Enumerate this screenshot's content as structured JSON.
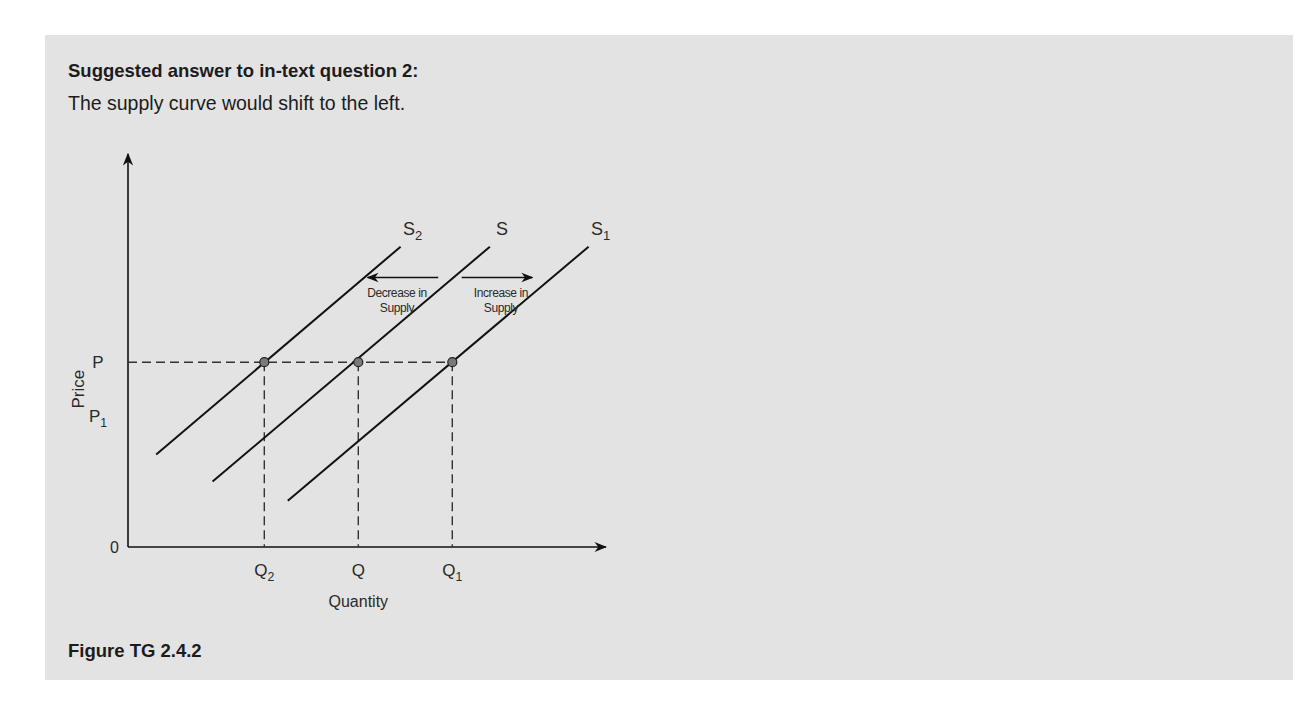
{
  "page": {
    "heading": "Suggested answer to in-text question 2:",
    "answer": "The supply curve would shift to the left.",
    "caption": "Figure TG 2.4.2"
  },
  "chart_data": {
    "type": "line",
    "title": "",
    "xlabel": "Quantity",
    "ylabel": "Price",
    "origin_label": "0",
    "xlim": [
      0,
      10
    ],
    "ylim": [
      0,
      10
    ],
    "grid": false,
    "legend": "none",
    "series": [
      {
        "name": "S2",
        "label_main": "S",
        "label_sub": "2",
        "points": [
          [
            0.6,
            2.4
          ],
          [
            5.8,
            7.8
          ]
        ]
      },
      {
        "name": "S",
        "label_main": "S",
        "label_sub": "",
        "points": [
          [
            1.8,
            1.7
          ],
          [
            7.7,
            7.8
          ]
        ]
      },
      {
        "name": "S1",
        "label_main": "S",
        "label_sub": "1",
        "points": [
          [
            3.4,
            1.2
          ],
          [
            9.8,
            7.8
          ]
        ]
      }
    ],
    "price_levels": [
      {
        "name": "P",
        "label_main": "P",
        "label_sub": "",
        "value": 4.8,
        "dashed": true
      },
      {
        "name": "P1",
        "label_main": "P",
        "label_sub": "1",
        "value": 3.4,
        "dashed": false
      }
    ],
    "quantity_levels": [
      {
        "name": "Q2",
        "label_main": "Q",
        "label_sub": "2",
        "value": 2.9
      },
      {
        "name": "Q",
        "label_main": "Q",
        "label_sub": "",
        "value": 4.9
      },
      {
        "name": "Q1",
        "label_main": "Q",
        "label_sub": "1",
        "value": 6.9
      }
    ],
    "equilibrium_points": [
      [
        2.9,
        4.8
      ],
      [
        4.9,
        4.8
      ],
      [
        6.9,
        4.8
      ]
    ],
    "annotations": [
      {
        "name": "decrease",
        "line1": "Decrease in",
        "line2": "Supply",
        "direction": "left",
        "x": [
          6.6,
          5.1
        ],
        "y": 7.0
      },
      {
        "name": "increase",
        "line1": "Increase in",
        "line2": "Supply",
        "direction": "right",
        "x": [
          7.1,
          8.6
        ],
        "y": 7.0
      }
    ],
    "colors": {
      "line": "#111111",
      "dash": "#333333",
      "point_fill": "#7a7a7a",
      "panel": "#e3e3e3"
    }
  }
}
